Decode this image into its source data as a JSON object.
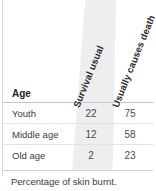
{
  "figure": {
    "caption": "Percentage of skin burnt."
  },
  "table": {
    "row_header_label": "Age",
    "column_headers": [
      "Survival usual",
      "Usually causes death"
    ],
    "rows": [
      {
        "label": "Youth",
        "survival_usual": "22",
        "usually_causes_death": "75"
      },
      {
        "label": "Middle age",
        "survival_usual": "12",
        "usually_causes_death": "58"
      },
      {
        "label": "Old age",
        "survival_usual": "2",
        "usually_causes_death": "23"
      }
    ]
  },
  "chart_data": {
    "type": "table",
    "title": "Percentage of skin burnt.",
    "xlabel": "",
    "ylabel": "Age",
    "categories": [
      "Youth",
      "Middle age",
      "Old age"
    ],
    "series": [
      {
        "name": "Survival usual",
        "values": [
          22,
          12,
          2
        ]
      },
      {
        "name": "Usually causes death",
        "values": [
          75,
          58,
          23
        ]
      }
    ],
    "grid": false,
    "legend": "none",
    "annotations": [
      "Percentage of skin burnt."
    ]
  },
  "style": {
    "highlight_band_color": "#eeeeee",
    "rule_color": "#d2d2d2",
    "header_text_color": "#1f1f1f",
    "body_text_color": "#3b3b3b",
    "value_text_color": "#4a4a4a",
    "background": "#ffffff"
  }
}
